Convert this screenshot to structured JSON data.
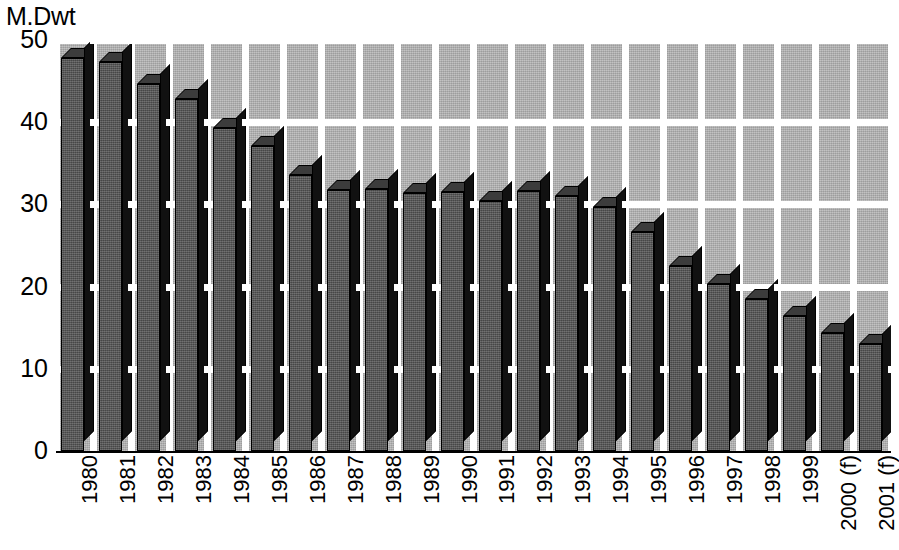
{
  "chart_data": {
    "type": "bar",
    "title": "",
    "ylabel": "M.Dwt",
    "xlabel": "",
    "ylim": [
      0,
      50
    ],
    "yticks": [
      0,
      10,
      20,
      30,
      40,
      50
    ],
    "grid": true,
    "legend": "none",
    "categories": [
      "1980",
      "1981",
      "1982",
      "1983",
      "1984",
      "1985",
      "1986",
      "1987",
      "1988",
      "1989",
      "1990",
      "1991",
      "1992",
      "1993",
      "1994",
      "1995",
      "1996",
      "1997",
      "1998",
      "1999",
      "2000 (f)",
      "2001 (f)"
    ],
    "category_years": [
      "1980",
      "1981",
      "1982",
      "1983",
      "1984",
      "1985",
      "1986",
      "1987",
      "1988",
      "1989",
      "1990",
      "1991",
      "1992",
      "1993",
      "1994",
      "1995",
      "1996",
      "1997",
      "1998",
      "1999",
      "2000",
      "2001"
    ],
    "category_notes": [
      "",
      "",
      "",
      "",
      "",
      "",
      "",
      "",
      "",
      "",
      "",
      "",
      "",
      "",
      "",
      "",
      "",
      "",
      "",
      "",
      "(f)",
      "(f)"
    ],
    "values": [
      47.8,
      47.3,
      44.7,
      42.8,
      39.3,
      37.1,
      33.6,
      31.8,
      31.9,
      31.4,
      31.5,
      30.4,
      31.6,
      31.0,
      29.7,
      26.6,
      22.5,
      20.3,
      18.5,
      16.4,
      14.3,
      13.0
    ],
    "forecast_flags": [
      false,
      false,
      false,
      false,
      false,
      false,
      false,
      false,
      false,
      false,
      false,
      false,
      false,
      false,
      false,
      false,
      false,
      false,
      false,
      false,
      true,
      true
    ],
    "colors": {
      "plot_background": "#b0b0b0",
      "gridline": "#ffffff",
      "bar_front": "#555555",
      "bar_side": "#111111",
      "bar_top": "#3c3c3c",
      "axis": "#000000",
      "text": "#000000"
    }
  }
}
